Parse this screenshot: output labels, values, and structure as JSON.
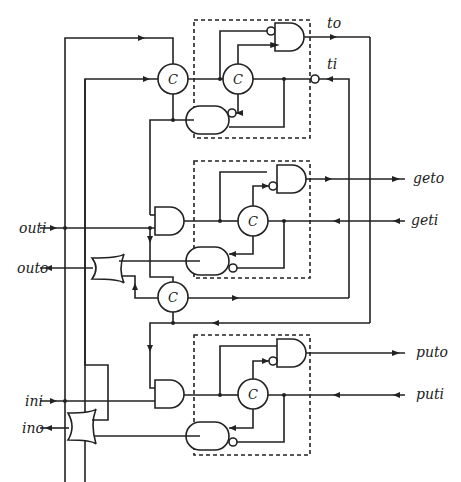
{
  "diagram": {
    "type": "asynchronous control circuit (C-elements and gates)",
    "c_element_label": "C",
    "signals": {
      "to": "to",
      "ti": "ti",
      "outi": "outi",
      "outo": "outo",
      "geto": "geto",
      "geti": "geti",
      "ini": "ini",
      "ino": "ino",
      "puto": "puto",
      "puti": "puti"
    },
    "blocks": [
      {
        "name": "top-dashed-block",
        "contents": [
          "C-element",
          "AND gate (inverted input)",
          "AND gate (inverted input)"
        ]
      },
      {
        "name": "middle-dashed-block",
        "contents": [
          "C-element",
          "AND gate (inverted input)",
          "AND gate (inverted input)"
        ]
      },
      {
        "name": "bottom-dashed-block",
        "contents": [
          "C-element",
          "AND gate (inverted input)",
          "AND gate (inverted input)"
        ]
      }
    ],
    "standalone_elements": [
      "C-element (top)",
      "C-element (middle)",
      "AND gate (outi)",
      "AND gate (ini)",
      "OR gate (outo)",
      "OR gate (ino)"
    ],
    "colors": {
      "line": "#222222",
      "background": "#ffffff"
    }
  }
}
